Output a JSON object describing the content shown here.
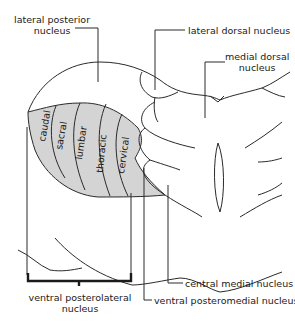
{
  "figure": {
    "type": "anatomical diagram"
  },
  "labels": {
    "lateral_posterior": [
      "lateral posterior",
      "nucleus"
    ],
    "lateral_dorsal": "lateral dorsal nucleus",
    "medial_dorsal": [
      "medial dorsal",
      "nucleus"
    ],
    "central_medial": "central medial nucleus",
    "ventral_posteromedial": "ventral posteromedial nucleus",
    "ventral_posterolateral": [
      "ventral posterolateral",
      "nucleus"
    ]
  },
  "segments": [
    "caudal",
    "sacral",
    "lumbar",
    "thoracic",
    "cervical"
  ],
  "colors": {
    "line": "#2a2a2a",
    "shaded_region": "#d4d4d4",
    "background": "#ffffff"
  }
}
